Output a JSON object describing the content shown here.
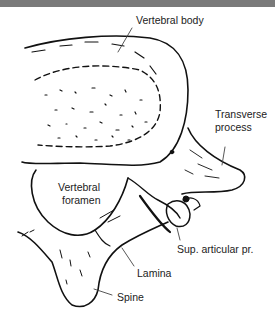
{
  "diagram": {
    "labels": {
      "vertebral_body": "Vertebral body",
      "transverse_process_line1": "Transverse",
      "transverse_process_line2": "process",
      "vertebral_foramen_line1": "Vertebral",
      "vertebral_foramen_line2": "foramen",
      "sup_articular": "Sup. articular pr.",
      "lamina": "Lamina",
      "spine": "Spine"
    },
    "colors": {
      "header_bar": "#7a7a7a",
      "ink": "#111111",
      "background": "#ffffff"
    }
  }
}
